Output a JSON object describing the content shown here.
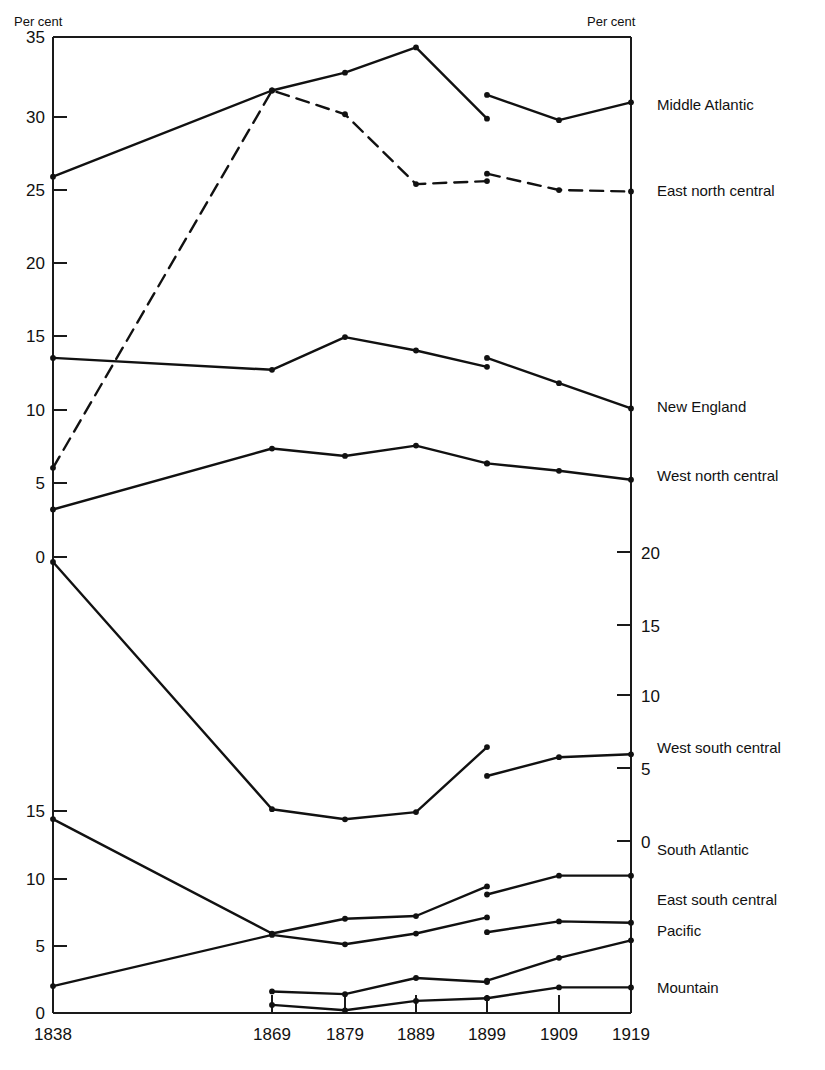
{
  "chart_data": {
    "type": "line",
    "title": "",
    "xlabel": "",
    "ylabel": "Per cent",
    "left_axis_title": "Per cent",
    "right_axis_title": "Per cent",
    "x_categories": [
      "1838",
      "1869",
      "1879",
      "1889",
      "1899",
      "1909",
      "1919"
    ],
    "axes": {
      "left_upper_ticks": [
        35,
        30,
        25,
        20,
        15,
        10,
        5,
        0
      ],
      "left_lower_ticks": [
        15,
        10,
        5,
        0
      ],
      "right_ticks": [
        20,
        15,
        10,
        5,
        0
      ],
      "grid": false,
      "note": "Three offset percentage scales share one panel; series are plotted on staggered baselines."
    },
    "legend_position": "right-of-axis",
    "series": [
      {
        "name": "Middle Atlantic",
        "style": "solid",
        "label_value": "Middle Atlantic",
        "x": [
          "1838",
          "1869",
          "1879",
          "1889",
          "1899",
          "1899",
          "1909",
          "1919"
        ],
        "values": [
          25.6,
          31.4,
          32.6,
          34.3,
          29.5,
          31.1,
          29.4,
          30.6
        ],
        "break_after_index": 4
      },
      {
        "name": "East north central",
        "style": "dashed",
        "label_value": "East north central",
        "x": [
          "1838",
          "1869",
          "1879",
          "1889",
          "1899",
          "1899",
          "1909",
          "1919"
        ],
        "values": [
          6.0,
          31.4,
          29.8,
          25.1,
          25.3,
          25.8,
          24.7,
          24.6
        ],
        "break_after_index": 4
      },
      {
        "name": "New England",
        "style": "solid",
        "label_value": "New England",
        "x": [
          "1838",
          "1869",
          "1879",
          "1889",
          "1899",
          "1899",
          "1909",
          "1919"
        ],
        "values": [
          13.4,
          12.6,
          14.8,
          13.9,
          12.8,
          13.4,
          11.7,
          10.0
        ],
        "break_after_index": 4
      },
      {
        "name": "West north central",
        "style": "solid",
        "label_value": "West north central",
        "x": [
          "1838",
          "1869",
          "1879",
          "1889",
          "1899",
          "1899",
          "1909",
          "1919"
        ],
        "values": [
          3.2,
          7.3,
          6.8,
          7.5,
          6.3,
          6.3,
          5.8,
          5.2
        ],
        "break_after_index": 4
      },
      {
        "name": "West south central",
        "style": "solid",
        "scale": "right",
        "label_value": "West south central",
        "x": [
          "1838",
          "1869",
          "1879",
          "1889",
          "1899",
          "1899",
          "1909",
          "1919"
        ],
        "values": [
          21.5,
          2.2,
          1.5,
          2.0,
          6.5,
          4.5,
          5.8,
          6.0
        ],
        "break_after_index": 4
      },
      {
        "name": "South Atlantic",
        "style": "solid",
        "scale": "left-lower",
        "label_value": "South Atlantic",
        "x": [
          "1838",
          "1869",
          "1879",
          "1889",
          "1899",
          "1899",
          "1909",
          "1919"
        ],
        "values": [
          14.4,
          5.9,
          7.0,
          7.2,
          9.4,
          8.8,
          10.2,
          10.2
        ],
        "break_after_index": 4
      },
      {
        "name": "East south central",
        "style": "solid",
        "scale": "left-lower",
        "label_value": "East south central",
        "x": [
          "1838",
          "1869",
          "1879",
          "1889",
          "1899",
          "1899",
          "1909",
          "1919"
        ],
        "values": [
          2.0,
          5.8,
          5.1,
          5.9,
          7.1,
          6.0,
          6.8,
          6.7
        ],
        "break_after_index": 4
      },
      {
        "name": "Pacific",
        "style": "solid",
        "scale": "left-lower",
        "label_value": "Pacific",
        "x": [
          "1869",
          "1879",
          "1889",
          "1899",
          "1899",
          "1909",
          "1919"
        ],
        "values": [
          1.6,
          1.4,
          2.6,
          2.3,
          2.4,
          4.1,
          5.4
        ],
        "break_after_index": 3
      },
      {
        "name": "Mountain",
        "style": "solid",
        "scale": "left-lower",
        "label_value": "Mountain",
        "x": [
          "1869",
          "1879",
          "1889",
          "1899",
          "1899",
          "1909",
          "1919"
        ],
        "values": [
          0.6,
          0.2,
          0.9,
          1.1,
          1.1,
          1.9,
          1.9
        ],
        "break_after_index": 3
      }
    ]
  },
  "left_axis": {
    "title": "Per cent",
    "upper_ticks": [
      {
        "label": "35",
        "y": 37
      },
      {
        "label": "30",
        "y": 117
      },
      {
        "label": "25",
        "y": 190
      },
      {
        "label": "20",
        "y": 263
      },
      {
        "label": "15",
        "y": 336
      },
      {
        "label": "10",
        "y": 410
      },
      {
        "label": "5",
        "y": 483
      },
      {
        "label": "0",
        "y": 557
      }
    ],
    "lower_ticks": [
      {
        "label": "15",
        "y": 811
      },
      {
        "label": "10",
        "y": 879
      },
      {
        "label": "5",
        "y": 946
      },
      {
        "label": "0",
        "y": 1013
      }
    ]
  },
  "right_axis": {
    "title": "Per cent",
    "ticks": [
      {
        "label": "20",
        "y": 552
      },
      {
        "label": "15",
        "y": 625
      },
      {
        "label": "10",
        "y": 695
      },
      {
        "label": "5",
        "y": 768
      },
      {
        "label": "0",
        "y": 841
      }
    ]
  },
  "x_axis": {
    "ticks": [
      {
        "label": "1838",
        "x": 53
      },
      {
        "label": "1869",
        "x": 272
      },
      {
        "label": "1879",
        "x": 345
      },
      {
        "label": "1889",
        "x": 416
      },
      {
        "label": "1899",
        "x": 487
      },
      {
        "label": "1909",
        "x": 559
      },
      {
        "label": "1919",
        "x": 631
      }
    ]
  },
  "series_labels": [
    {
      "text": "Middle Atlantic",
      "x": 657,
      "y": 110
    },
    {
      "text": "East north central",
      "x": 657,
      "y": 196
    },
    {
      "text": "New England",
      "x": 657,
      "y": 412
    },
    {
      "text": "West north central",
      "x": 657,
      "y": 481
    },
    {
      "text": "West south central",
      "x": 657,
      "y": 753
    },
    {
      "text": "South Atlantic",
      "x": 657,
      "y": 855
    },
    {
      "text": "East south central",
      "x": 657,
      "y": 905
    },
    {
      "text": "Pacific",
      "x": 657,
      "y": 936
    },
    {
      "text": "Mountain",
      "x": 657,
      "y": 993
    }
  ],
  "colors": {
    "ink": "#111111",
    "background": "#ffffff"
  }
}
